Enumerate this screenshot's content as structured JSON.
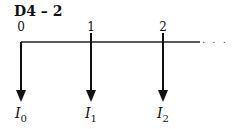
{
  "title": "D4 – 2",
  "timeline": {
    "ticks": [
      {
        "label": "0",
        "x": 21
      },
      {
        "label": "1",
        "x": 91
      },
      {
        "label": "2",
        "x": 163
      }
    ],
    "continuation": ". . ."
  },
  "flows": [
    {
      "symbol": "I",
      "sub": "0",
      "direction": "down"
    },
    {
      "symbol": "I",
      "sub": "1",
      "direction": "down"
    },
    {
      "symbol": "I",
      "sub": "2",
      "direction": "down"
    }
  ]
}
